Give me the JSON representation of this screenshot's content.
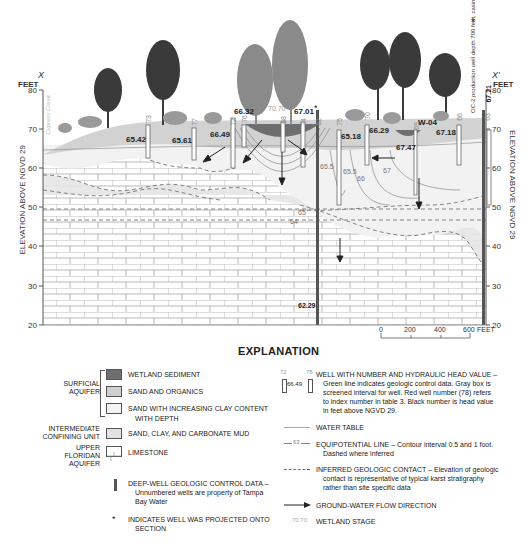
{
  "section": {
    "left_label": "X",
    "right_label": "X'",
    "units_label": "FEET",
    "y_axis_title": "ELEVATION ABOVE NGVD 29",
    "y_ticks": [
      80,
      70,
      60,
      50,
      40,
      30,
      20
    ],
    "creek_label": "Cypress Creek",
    "production_well_note": "OC-2 production well depth 700 feet, casing 118 feet",
    "production_well_star": "*",
    "wetland_stage": "70.70",
    "wetland_name": "W-04",
    "deep_well_head": "62.29"
  },
  "wells": [
    {
      "number": "73",
      "head": "65.42"
    },
    {
      "number": "77",
      "head": "65.61"
    },
    {
      "number": "72",
      "head": "66.49"
    },
    {
      "number": "76",
      "head": "66.32"
    },
    {
      "number": "68",
      "head": ""
    },
    {
      "number": "74",
      "head": "67.01"
    },
    {
      "number": "62",
      "head": "",
      "projected": "*"
    },
    {
      "number": "75",
      "head": "65.18"
    },
    {
      "number": "70",
      "head": "66.29"
    },
    {
      "number": "69",
      "head": "67.47"
    },
    {
      "number": "66",
      "head": "67.18"
    },
    {
      "number": "63",
      "head": "67.21"
    }
  ],
  "equipotentials": [
    "65.5",
    "65.5",
    "66",
    "67",
    "65",
    "64",
    "66",
    "66"
  ],
  "scale_bar": {
    "ticks": [
      "0",
      "200",
      "400",
      "600"
    ],
    "unit": "FEET"
  },
  "explanation": {
    "title": "EXPLANATION",
    "groups": [
      {
        "label": "SURFICIAL AQUIFER"
      },
      {
        "label": "INTERMEDIATE CONFINING UNIT"
      },
      {
        "label": "UPPER FLORIDAN AQUIFER"
      }
    ],
    "units": [
      {
        "label": "WETLAND  SEDIMENT",
        "color": "#6e6e6e"
      },
      {
        "label": "SAND AND  ORGANICS",
        "color": "#cfcfcf"
      },
      {
        "label": "SAND  WITH INCREASING CLAY CONTENT",
        "label2": "WITH DEPTH",
        "color": "#f3f3f3"
      },
      {
        "label": "SAND, CLAY, AND CARBONATE MUD",
        "color": "#e2e2e2"
      },
      {
        "label": "LIMESTONE",
        "color": "#ffffff"
      }
    ],
    "deep_well": {
      "label": "DEEP-WELL GEOLOGIC CONTROL DATA –",
      "desc1": "Unnumbered wells are property of Tampa",
      "desc2": "Bay Water"
    },
    "projected": {
      "symbol": "*",
      "label": "INDICATES WELL WAS PROJECTED ONTO",
      "label2": "SECTION"
    },
    "well_symbol": {
      "num1": "72",
      "num2": "78",
      "head": "66.49",
      "label": "WELL WITH NUMBER AND HYDRAULIC HEAD VALUE –",
      "desc1": "Green line indicates geologic control data. Gray box is",
      "desc2": "screened interval for well.  Red well number (78) refers",
      "desc3": "to index number in table 3. Black number is head value",
      "desc4": "in feet above NGVD 29."
    },
    "water_table": {
      "label": "WATER TABLE"
    },
    "equipotential": {
      "sample": "63",
      "label": "EQUIPOTENTIAL LINE – Contour interval 0.5 and 1 foot.",
      "desc": "Dashed where inferred"
    },
    "inferred_contact": {
      "label": "INFERRED GEOLOGIC CONTACT – Elevation of geologic",
      "desc1": "contact is representative of typical karst stratigraphy",
      "desc2": "rather than site specific data"
    },
    "flow": {
      "label": "GROUND-WATER FLOW DIRECTION"
    },
    "wetland_stage": {
      "sample": "70.70",
      "label": "WETLAND STAGE"
    }
  }
}
